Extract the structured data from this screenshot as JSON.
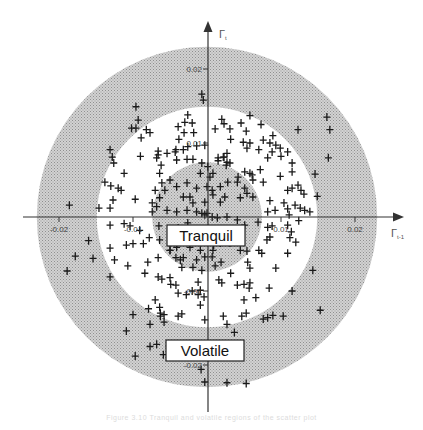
{
  "figure": {
    "caption": "Figure 3.10  Tranquil and volatile regions of the scatter plot"
  },
  "chart_data": {
    "type": "scatter",
    "title": "",
    "xlabel": "Γt-1",
    "ylabel": "Γt",
    "x_axis_label_main": "Γ",
    "x_axis_label_sub": "t-1",
    "y_axis_label_main": "Γ",
    "y_axis_label_sub": "t",
    "xlim": [
      -0.025,
      0.026
    ],
    "ylim": [
      -0.027,
      0.026
    ],
    "grid": false,
    "legend": null,
    "marker": "+",
    "x_ticks": [
      {
        "value": -0.02,
        "label": "-0.02"
      },
      {
        "value": -0.01,
        "label": "-0.01"
      },
      {
        "value": 0.01,
        "label": "0.01"
      },
      {
        "value": 0.02,
        "label": "0.02"
      }
    ],
    "y_ticks": [
      {
        "value": 0.02,
        "label": "0.02"
      },
      {
        "value": 0.01,
        "label": "0.01"
      },
      {
        "value": -0.01,
        "label": "-0.01"
      },
      {
        "value": -0.02,
        "label": "-0.02"
      }
    ],
    "regions": [
      {
        "name": "Volatile",
        "shape": "annulus",
        "inner_radius": 0.0149,
        "outer_radius": 0.023,
        "fill": "#bdbdbd",
        "label": "Volatile"
      },
      {
        "name": "Tranquil",
        "shape": "disk",
        "radius": 0.0074,
        "fill": "#c4c4c4",
        "label": "Tranquil"
      }
    ],
    "annotations": [
      {
        "text": "Tranquil",
        "x": 0.0005,
        "y": -0.0025
      },
      {
        "text": "Volatile",
        "x": 0.0,
        "y": -0.0185
      }
    ],
    "points": [
      [
        -0.0007,
        0.0166
      ],
      [
        -0.0005,
        0.0158
      ],
      [
        0.0058,
        0.0137
      ],
      [
        0.0073,
        0.0125
      ],
      [
        0.0123,
        0.0118
      ],
      [
        -0.0102,
        0.012
      ],
      [
        -0.0039,
        0.0122
      ],
      [
        -0.0038,
        0.0105
      ],
      [
        -0.009,
        0.0082
      ],
      [
        0.0089,
        0.011
      ],
      [
        0.0164,
        0.008
      ],
      [
        0.0109,
        0.0036
      ],
      [
        0.0131,
        0.0031
      ],
      [
        -0.0186,
        0.0016
      ],
      [
        -0.0178,
        -0.0053
      ],
      [
        -0.0189,
        -0.0073
      ],
      [
        -0.0154,
        -0.0056
      ],
      [
        -0.016,
        -0.0032
      ],
      [
        0.0093,
        -0.0069
      ],
      [
        0.0084,
        -0.0096
      ],
      [
        0.0089,
        -0.0133
      ],
      [
        0.0082,
        -0.0136
      ],
      [
        0.0053,
        -0.013
      ],
      [
        -0.0077,
        -0.0145
      ],
      [
        -0.0077,
        -0.0175
      ],
      [
        -0.0051,
        -0.0175
      ],
      [
        -0.0097,
        -0.0188
      ],
      [
        -0.0079,
        -0.0124
      ],
      [
        -0.0063,
        -0.013
      ],
      [
        -0.0063,
        -0.0134
      ],
      [
        0.0037,
        -0.0156
      ],
      [
        0.0027,
        -0.0145
      ],
      [
        -0.0003,
        -0.0223
      ],
      [
        0.0027,
        -0.0224
      ],
      [
        0.0053,
        -0.0225
      ],
      [
        -0.0008,
        -0.0206
      ],
      [
        -0.0096,
        0.0149
      ],
      [
        -0.0093,
        0.0131
      ],
      [
        -0.0096,
        0.012
      ],
      [
        -0.0082,
        0.0118
      ],
      [
        -0.0089,
        0.0107
      ],
      [
        -0.0077,
        0.0114
      ],
      [
        -0.0131,
        0.0091
      ],
      [
        -0.0128,
        0.0081
      ],
      [
        -0.0126,
        0.0073
      ],
      [
        -0.0066,
        0.0089
      ],
      [
        -0.0068,
        0.008
      ],
      [
        -0.0062,
        0.007
      ],
      [
        -0.0061,
        0.0046
      ],
      [
        -0.0042,
        0.0091
      ],
      [
        -0.0041,
        0.0077
      ],
      [
        -0.0112,
        0.0059
      ],
      [
        -0.0138,
        0.0047
      ],
      [
        -0.013,
        0.0042
      ],
      [
        -0.012,
        0.0039
      ],
      [
        -0.0116,
        0.0036
      ],
      [
        -0.0127,
        0.0023
      ],
      [
        -0.0097,
        0.0024
      ],
      [
        -0.0131,
        0.0012
      ],
      [
        -0.0146,
        0.0012
      ],
      [
        -0.0026,
        0.0138
      ],
      [
        -0.003,
        0.0128
      ],
      [
        -0.002,
        0.0127
      ],
      [
        -0.0018,
        0.0114
      ],
      [
        -0.0031,
        0.0114
      ],
      [
        -0.0014,
        0.0096
      ],
      [
        -0.0019,
        0.0078
      ],
      [
        -0.0027,
        0.0078
      ],
      [
        -0.0074,
        0.0007
      ],
      [
        0.002,
        0.0132
      ],
      [
        0.0023,
        0.0126
      ],
      [
        0.0011,
        0.0119
      ],
      [
        0.0031,
        0.0119
      ],
      [
        0.0046,
        0.0127
      ],
      [
        0.0053,
        0.0116
      ],
      [
        0.0032,
        0.0105
      ],
      [
        0.0049,
        0.0101
      ],
      [
        0.0054,
        0.0093
      ],
      [
        0.0058,
        0.01
      ],
      [
        0.0027,
        0.0086
      ],
      [
        0.0023,
        0.0081
      ],
      [
        0.0015,
        0.0076
      ],
      [
        0.0026,
        0.007
      ],
      [
        0.0031,
        0.0073
      ],
      [
        0.0008,
        0.0059
      ],
      [
        0.0076,
        0.0104
      ],
      [
        0.0085,
        0.01
      ],
      [
        0.0093,
        0.0097
      ],
      [
        0.0099,
        0.0093
      ],
      [
        0.0088,
        0.0088
      ],
      [
        0.01,
        0.0082
      ],
      [
        0.0109,
        0.0088
      ],
      [
        0.007,
        0.0091
      ],
      [
        0.0082,
        0.008
      ],
      [
        0.0072,
        0.0064
      ],
      [
        0.0099,
        0.0055
      ],
      [
        0.0076,
        0.0047
      ],
      [
        0.0115,
        0.0061
      ],
      [
        0.0115,
        0.0073
      ],
      [
        0.0051,
        0.0061
      ],
      [
        0.0061,
        0.0057
      ],
      [
        0.0062,
        0.005
      ],
      [
        0.0051,
        0.0039
      ],
      [
        0.0115,
        0.0039
      ],
      [
        0.0123,
        0.0043
      ],
      [
        0.0127,
        0.0036
      ],
      [
        0.0119,
        0.0016
      ],
      [
        0.0126,
        0.0012
      ],
      [
        0.0132,
        0.0009
      ],
      [
        0.0139,
        0.0007
      ],
      [
        0.0104,
        0.0019
      ],
      [
        0.0109,
        0.0011
      ],
      [
        0.0085,
        0.0022
      ],
      [
        0.0092,
        0.0009
      ],
      [
        0.0082,
        0.0007
      ],
      [
        0.0111,
        0.0003
      ],
      [
        0.0124,
        -0.0005
      ],
      [
        0.0162,
        0.0135
      ],
      [
        0.0166,
        0.0118
      ],
      [
        0.0146,
        0.0058
      ],
      [
        0.0149,
        0.0028
      ],
      [
        -0.0131,
        -0.0011
      ],
      [
        -0.0112,
        -0.0009
      ],
      [
        -0.0104,
        -0.0012
      ],
      [
        -0.0091,
        -0.0018
      ],
      [
        -0.0078,
        -0.0028
      ],
      [
        -0.0086,
        -0.0036
      ],
      [
        -0.0065,
        -0.0012
      ],
      [
        -0.0109,
        -0.0038
      ],
      [
        -0.01,
        -0.0036
      ],
      [
        -0.0131,
        -0.0042
      ],
      [
        -0.0064,
        -0.0031
      ],
      [
        -0.0066,
        -0.0055
      ],
      [
        -0.008,
        -0.0061
      ],
      [
        -0.005,
        -0.0045
      ],
      [
        -0.0042,
        -0.0055
      ],
      [
        -0.0032,
        -0.0055
      ],
      [
        -0.0034,
        -0.0068
      ],
      [
        -0.005,
        -0.0082
      ],
      [
        -0.0125,
        -0.0058
      ],
      [
        -0.0107,
        -0.0066
      ],
      [
        -0.0131,
        -0.0081
      ],
      [
        -0.0084,
        -0.0076
      ],
      [
        -0.0066,
        -0.0081
      ],
      [
        -0.0061,
        -0.0084
      ],
      [
        -0.0049,
        -0.0091
      ],
      [
        -0.0042,
        -0.0092
      ],
      [
        -0.0039,
        -0.0103
      ],
      [
        -0.0028,
        -0.0105
      ],
      [
        -0.002,
        -0.01
      ],
      [
        -0.0012,
        -0.0105
      ],
      [
        -0.0012,
        -0.0088
      ],
      [
        -0.0009,
        -0.0099
      ],
      [
        -0.007,
        -0.0112
      ],
      [
        -0.0064,
        -0.0122
      ],
      [
        -0.0058,
        -0.0132
      ],
      [
        -0.01,
        -0.0132
      ],
      [
        -0.0058,
        -0.0142
      ],
      [
        -0.0109,
        -0.0154
      ],
      [
        -0.0039,
        -0.0134
      ],
      [
        -0.0034,
        -0.0131
      ],
      [
        -0.0009,
        -0.0119
      ],
      [
        -0.0004,
        -0.0108
      ],
      [
        -0.0003,
        -0.0139
      ],
      [
        -0.0068,
        -0.0172
      ],
      [
        -0.0059,
        -0.0186
      ],
      [
        0.0069,
        -0.0007
      ],
      [
        0.0082,
        -0.0014
      ],
      [
        0.0088,
        -0.0012
      ],
      [
        0.0085,
        -0.0027
      ],
      [
        0.0081,
        -0.0031
      ],
      [
        0.007,
        -0.0045
      ],
      [
        0.0109,
        -0.0011
      ],
      [
        0.0112,
        -0.0028
      ],
      [
        0.0114,
        -0.002
      ],
      [
        0.012,
        -0.0034
      ],
      [
        0.0109,
        -0.0049
      ],
      [
        0.0074,
        -0.0049
      ],
      [
        0.0054,
        -0.0046
      ],
      [
        0.0055,
        -0.0061
      ],
      [
        0.0058,
        -0.0069
      ],
      [
        0.0011,
        -0.0066
      ],
      [
        0.0019,
        -0.0061
      ],
      [
        0.0032,
        -0.0076
      ],
      [
        0.0041,
        -0.0092
      ],
      [
        0.005,
        -0.0091
      ],
      [
        0.0058,
        -0.0089
      ],
      [
        0.0057,
        -0.0096
      ],
      [
        0.0066,
        -0.0109
      ],
      [
        0.002,
        -0.0089
      ],
      [
        0.0016,
        -0.0085
      ],
      [
        0.005,
        -0.0112
      ],
      [
        0.0143,
        -0.0072
      ],
      [
        0.0115,
        -0.01
      ],
      [
        0.0022,
        -0.0134
      ],
      [
        0.0047,
        -0.0134
      ],
      [
        0.0076,
        -0.0138
      ],
      [
        0.0103,
        -0.0134
      ],
      [
        0.0153,
        -0.0126
      ],
      [
        0.0007,
        -0.0054
      ],
      [
        0.0009,
        -0.0038
      ],
      [
        0.0045,
        -0.0018
      ],
      [
        0.0051,
        -0.0011
      ],
      [
        0.0007,
        -0.0024
      ],
      [
        -0.0066,
        0.0084
      ],
      [
        -0.0054,
        0.0086
      ],
      [
        -0.0043,
        0.0088
      ],
      [
        -0.0032,
        0.0091
      ],
      [
        -0.0026,
        0.0095
      ],
      [
        -0.0003,
        0.0097
      ],
      [
        -0.0007,
        0.0073
      ],
      [
        0.0001,
        0.0068
      ],
      [
        0.0015,
        0.008
      ],
      [
        0.0022,
        0.0081
      ],
      [
        0.0027,
        0.0074
      ],
      [
        0.0042,
        0.0054
      ],
      [
        0.0041,
        0.0047
      ],
      [
        0.0058,
        0.0059
      ],
      [
        0.0054,
        0.0032
      ],
      [
        0.0024,
        0.0027
      ],
      [
        0.0018,
        0.002
      ],
      [
        0.0008,
        0.003
      ],
      [
        0.0,
        0.0041
      ],
      [
        -0.0014,
        0.0039
      ],
      [
        -0.0023,
        0.0027
      ],
      [
        -0.0032,
        0.0027
      ],
      [
        -0.0041,
        0.0041
      ],
      [
        -0.005,
        0.005
      ],
      [
        -0.0057,
        0.0036
      ],
      [
        -0.0064,
        0.0026
      ],
      [
        -0.0068,
        0.0014
      ],
      [
        -0.0054,
        0.0009
      ],
      [
        -0.0041,
        0.0007
      ],
      [
        -0.0027,
        0.0009
      ],
      [
        -0.0014,
        0.0007
      ],
      [
        -0.0007,
        0.0005
      ],
      [
        -0.0003,
        0.0003
      ],
      [
        0.0,
        0.0005
      ],
      [
        0.0007,
        0.0
      ],
      [
        0.0014,
        -0.0001
      ],
      [
        0.0027,
        0.0
      ],
      [
        0.0041,
        -0.0004
      ],
      [
        -0.0041,
        -0.0041
      ],
      [
        -0.0023,
        -0.0041
      ],
      [
        -0.0009,
        -0.0045
      ],
      [
        -0.0003,
        -0.0054
      ],
      [
        -0.0014,
        -0.0058
      ],
      [
        -0.0036,
        -0.0058
      ],
      [
        -0.005,
        -0.0045
      ],
      [
        0.0018,
        -0.0035
      ],
      [
        0.0031,
        -0.0035
      ],
      [
        0.0045,
        -0.0045
      ],
      [
        0.0008,
        -0.0045
      ],
      [
        -0.0019,
        -0.0068
      ],
      [
        -0.0007,
        -0.0072
      ],
      [
        -0.0039,
        -0.0015
      ],
      [
        -0.0026,
        -0.0008
      ],
      [
        -0.0019,
        0.0019
      ],
      [
        -0.0027,
        0.0046
      ],
      [
        0.0004,
        0.0054
      ],
      [
        -0.0009,
        0.0059
      ],
      [
        0.0028,
        0.0047
      ],
      [
        0.0018,
        0.0041
      ],
      [
        0.0045,
        0.0026
      ],
      [
        0.0062,
        0.0027
      ],
      [
        -0.0064,
        0.0059
      ],
      [
        -0.007,
        0.0036
      ],
      [
        -0.0074,
        0.0019
      ],
      [
        0.0007,
        0.0036
      ],
      [
        -0.0003,
        0.002
      ]
    ]
  }
}
